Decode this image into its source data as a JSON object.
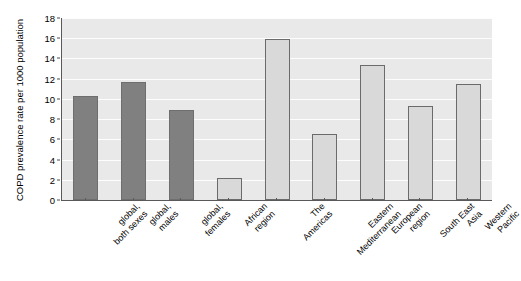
{
  "chart_data": {
    "type": "bar",
    "title": "",
    "xlabel": "",
    "ylabel": "COPD prevalence rate per 1000 population",
    "ylim": [
      0,
      18
    ],
    "ytick_step": 2,
    "yticks": [
      0,
      2,
      4,
      6,
      8,
      10,
      12,
      14,
      16,
      18
    ],
    "grid": true,
    "legend": "none",
    "categories": [
      "global,\nboth sexes",
      "global,\nmales",
      "global,\nfemales",
      "African\nregion",
      "The\nAmericas",
      "Eastern\nMediterranean",
      "European\nregion",
      "South East\nAsia",
      "Western\nPacific"
    ],
    "category_lines": [
      [
        "global,",
        "both sexes"
      ],
      [
        "global,",
        "males"
      ],
      [
        "global,",
        "females"
      ],
      [
        "African",
        "region"
      ],
      [
        "The",
        "Americas"
      ],
      [
        "Eastern",
        "Mediterranean"
      ],
      [
        "European",
        "region"
      ],
      [
        "South East",
        "Asia"
      ],
      [
        "Western",
        "Pacific"
      ]
    ],
    "values": [
      10.3,
      11.7,
      8.9,
      2.2,
      15.9,
      6.5,
      13.4,
      9.3,
      11.5
    ],
    "bar_styles": [
      "dark",
      "dark",
      "dark",
      "light",
      "light",
      "light",
      "light",
      "light",
      "light"
    ],
    "colors": {
      "bar_dark_fill": "#808080",
      "bar_light_fill": "#d9d9d9",
      "bar_edge": "#6b6b6b",
      "plot_background": "#e9e9e9",
      "gridline": "#fdfdfd",
      "axis": "#595959",
      "text": "#000000",
      "figure_background": "#ffffff"
    }
  }
}
